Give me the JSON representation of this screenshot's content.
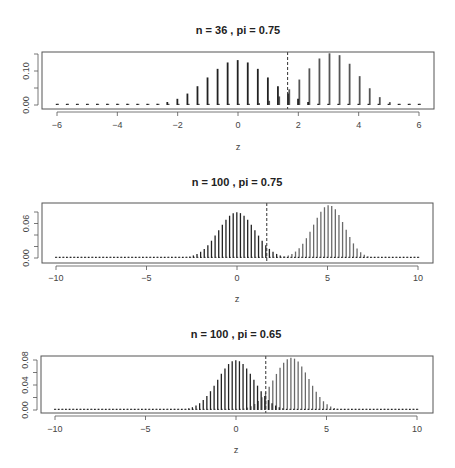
{
  "chart_data": [
    {
      "type": "bar",
      "title": "n = 36 , pi = 0.75",
      "n": 36,
      "pi": 0.75,
      "p0": 0.5,
      "xlabel": "z",
      "ylabel": "",
      "xlim": [
        -6.5,
        6.5
      ],
      "ylim": [
        0,
        0.155
      ],
      "xticks": [
        -6,
        -4,
        -2,
        0,
        2,
        4,
        6
      ],
      "xtick_labels": [
        "-6",
        "-4",
        "-2",
        "0",
        "2",
        "4",
        "6"
      ],
      "yticks": [
        0,
        0.05,
        0.1,
        0.15
      ],
      "ytick_labels": [
        "0.00",
        "",
        "0.10",
        ""
      ],
      "critical_z": 1.645,
      "grid": false,
      "legend": null,
      "series": [
        {
          "name": "null (p = 0.5)",
          "color": "#222222"
        },
        {
          "name": "alternative (pi = 0.75)",
          "color": "#555555"
        }
      ],
      "layout": {
        "left": 42,
        "right": 434,
        "top": 52,
        "bottom": 109,
        "x_at_min_tick": 57,
        "x_at_max_tick": 419,
        "y_zero": 105,
        "y_top_tick": 54,
        "title_y": 34,
        "ticklabel_y": 128,
        "xlabel_y": 150
      }
    },
    {
      "type": "bar",
      "title": "n = 100 , pi = 0.75",
      "n": 100,
      "pi": 0.75,
      "p0": 0.5,
      "xlabel": "z",
      "ylabel": "",
      "xlim": [
        -10.8,
        10.8
      ],
      "ylim": [
        0,
        0.092
      ],
      "xticks": [
        -10,
        -5,
        0,
        5,
        10
      ],
      "xtick_labels": [
        "-10",
        "-5",
        "0",
        "5",
        "10"
      ],
      "yticks": [
        0,
        0.02,
        0.04,
        0.06,
        0.08
      ],
      "ytick_labels": [
        "0.00",
        "",
        "",
        "0.06",
        ""
      ],
      "critical_z": 1.645,
      "grid": false,
      "legend": null,
      "series": [
        {
          "name": "null (p = 0.5)",
          "color": "#222222"
        },
        {
          "name": "alternative (pi = 0.75)",
          "color": "#6a6a6a"
        }
      ],
      "layout": {
        "left": 42,
        "right": 433,
        "top": 203,
        "bottom": 263,
        "x_at_min_tick": 56,
        "x_at_max_tick": 418,
        "y_zero": 258,
        "y_top_tick": 212,
        "title_y": 186,
        "ticklabel_y": 281,
        "xlabel_y": 302
      }
    },
    {
      "type": "bar",
      "title": "n = 100 , pi = 0.65",
      "n": 100,
      "pi": 0.65,
      "p0": 0.5,
      "xlabel": "z",
      "ylabel": "",
      "xlim": [
        -10.8,
        10.8
      ],
      "ylim": [
        0,
        0.084
      ],
      "xticks": [
        -10,
        -5,
        0,
        5,
        10
      ],
      "xtick_labels": [
        "-10",
        "-5",
        "0",
        "5",
        "10"
      ],
      "yticks": [
        0,
        0.02,
        0.04,
        0.06,
        0.08
      ],
      "ytick_labels": [
        "0.00",
        "",
        "0.04",
        "",
        "0.08"
      ],
      "critical_z": 1.645,
      "grid": false,
      "legend": null,
      "series": [
        {
          "name": "null (p = 0.5)",
          "color": "#222222"
        },
        {
          "name": "alternative (pi = 0.65)",
          "color": "#6a6a6a"
        }
      ],
      "layout": {
        "left": 41,
        "right": 433,
        "top": 356,
        "bottom": 413,
        "x_at_min_tick": 55,
        "x_at_max_tick": 417,
        "y_zero": 410,
        "y_top_tick": 360,
        "title_y": 338,
        "ticklabel_y": 432,
        "xlabel_y": 453
      }
    }
  ]
}
